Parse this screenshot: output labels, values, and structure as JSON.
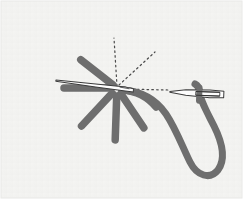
{
  "figure": {
    "alt_text": "An embroidery instruction illustration: a six-armed star of gray straight stitches, a bare needle laid across them, and a second needle threaded with a long curving gray thread at the right. Dotted guide lines radiate from the star centre.",
    "panel": {
      "background_color": "#f4f4f2",
      "border_color": "#e8e8e6",
      "x": 1,
      "y": 1,
      "width": 241,
      "height": 197
    },
    "page_background_color": "#ffffff"
  },
  "palette": {
    "thread_gray": "#6e6e6e",
    "thread_gray_dark": "#5c5c5c",
    "needle_outline": "#3c3c3c",
    "needle_fill": "#fdfdfd",
    "guide_dotted": "#4a4a4a",
    "panel_fill": "#f4f4f2"
  },
  "star_stitch": {
    "label": "star-stitch-cluster",
    "center": {
      "x": 117,
      "y": 88
    },
    "stitch_width": 7,
    "color": "#6e6e6e",
    "arm_count": 6,
    "arms": [
      {
        "name": "arm-upper-left",
        "angle_deg": 218,
        "length": 46,
        "inner_gap": 5
      },
      {
        "name": "arm-left",
        "angle_deg": 180,
        "length": 53,
        "inner_gap": 6
      },
      {
        "name": "arm-lower-left",
        "angle_deg": 133,
        "length": 52,
        "inner_gap": 7
      },
      {
        "name": "arm-down",
        "angle_deg": 92,
        "length": 52,
        "inner_gap": 8
      },
      {
        "name": "arm-lower-right",
        "angle_deg": 56,
        "length": 48,
        "inner_gap": 7
      },
      {
        "name": "arm-right-curve",
        "angle_deg": 20,
        "length": 44,
        "inner_gap": 6
      }
    ]
  },
  "guide_lines": {
    "label": "dotted-guide-lines",
    "color": "#4a4a4a",
    "dash": "1.6 3.2",
    "stroke_width": 1.2,
    "lines": [
      {
        "name": "guide-vertical",
        "x1": 117,
        "y1": 86,
        "x2": 114,
        "y2": 38
      },
      {
        "name": "guide-diagonal",
        "x1": 119,
        "y1": 85,
        "x2": 155,
        "y2": 52
      },
      {
        "name": "guide-horizontal",
        "x1": 123,
        "y1": 89,
        "x2": 168,
        "y2": 90
      }
    ]
  },
  "needles": [
    {
      "name": "needle-bare-left",
      "description": "Bare needle laid across the star, point toward the lower left",
      "tip": {
        "x": 56,
        "y": 80
      },
      "tail": {
        "x": 131,
        "y": 86
      },
      "fill": "#fdfdfd",
      "outline": "#3c3c3c"
    },
    {
      "name": "needle-threaded-right",
      "description": "Needle threaded with working thread at the right, eye toward the right",
      "tip": {
        "x": 170,
        "y": 89
      },
      "tail": {
        "x": 224,
        "y": 94
      },
      "fill": "#fdfdfd",
      "outline": "#3c3c3c",
      "has_thread_through_eye": true
    }
  ],
  "thread": {
    "name": "working-thread",
    "color": "#6e6e6e",
    "stroke_width": 7,
    "description": "Gray thread leaving the star centre, curving down and right into a long loop that rises to the threaded needle's eye",
    "path": "M 122 90 C 146 93, 162 104, 172 124 C 182 144, 190 164, 200 172 C 212 180, 223 170, 220 152 C 217 133, 206 118, 202 104 C 199 95, 199 92, 199 88"
  },
  "legend": {
    "visible": false,
    "items": []
  },
  "annotations": {
    "visible_text": []
  }
}
